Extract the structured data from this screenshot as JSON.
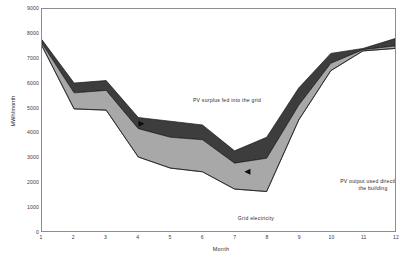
{
  "chart_data": {
    "type": "area",
    "title": "",
    "subtitle": "",
    "xlabel": "Month",
    "ylabel": "MWh/month",
    "xlim": [
      1,
      12
    ],
    "ylim": [
      0,
      9000
    ],
    "grid": false,
    "legend_position": "inline-annotations",
    "stacked": true,
    "x": [
      1,
      2,
      3,
      4,
      5,
      6,
      7,
      8,
      9,
      10,
      11,
      12
    ],
    "x_tick_labels": [
      "1",
      "2",
      "3",
      "4",
      "5",
      "6",
      "7",
      "8",
      "9",
      "10",
      "11",
      "12"
    ],
    "y_tick_labels": [
      "0",
      "1000",
      "2000",
      "3000",
      "4000",
      "5000",
      "6000",
      "7000",
      "8000",
      "9000"
    ],
    "y_ticks": [
      0,
      1000,
      2000,
      3000,
      4000,
      5000,
      6000,
      7000,
      8000,
      9000
    ],
    "boundaries": {
      "grid_electricity_top": [
        7500,
        4950,
        4900,
        3000,
        2550,
        2400,
        1700,
        1600,
        4500,
        6500,
        7300,
        7400
      ],
      "pv_direct_top": [
        7600,
        5600,
        5700,
        4150,
        3800,
        3700,
        2750,
        2950,
        5100,
        6800,
        7350,
        7500
      ],
      "pv_surplus_top": [
        7750,
        6000,
        6100,
        4600,
        4450,
        4300,
        3250,
        3800,
        5800,
        7200,
        7400,
        7800
      ]
    },
    "series": [
      {
        "name": "Grid electricity",
        "color": "#ffffff",
        "values": [
          7500,
          4950,
          4900,
          3000,
          2550,
          2400,
          1700,
          1600,
          4500,
          6500,
          7300,
          7400
        ]
      },
      {
        "name": "PV output used directly by the building",
        "color": "#a8a8a8",
        "values": [
          100,
          650,
          800,
          1150,
          1250,
          1300,
          1050,
          1350,
          600,
          300,
          50,
          100
        ]
      },
      {
        "name": "PV surplus fed into the grid",
        "color": "#3d3d3d",
        "values": [
          150,
          400,
          400,
          450,
          650,
          600,
          500,
          850,
          700,
          400,
          50,
          300
        ]
      }
    ],
    "annotations": [
      {
        "name": "pv-surplus-annotation",
        "text": "PV surplus fed into the grid",
        "marker": "right-triangle",
        "marker_at": [
          4.1,
          4350
        ]
      },
      {
        "name": "pv-direct-annotation",
        "text": "PV output used directly by\nthe building",
        "marker": "left-triangle",
        "marker_at": [
          7.4,
          2400
        ]
      },
      {
        "name": "grid-electricity-annotation",
        "text": "Grid  electricity",
        "marker": "none",
        "marker_at": null
      }
    ],
    "colors": {
      "band_surplus": "#3d3d3d",
      "band_direct": "#a8a8a8",
      "band_grid": "#ffffff",
      "outline": "#1a1a1a",
      "frame": "#8d8d8d",
      "text": "#2b2b2b"
    }
  },
  "axes": {
    "y_title": "MWh/month",
    "x_title": "Month"
  }
}
